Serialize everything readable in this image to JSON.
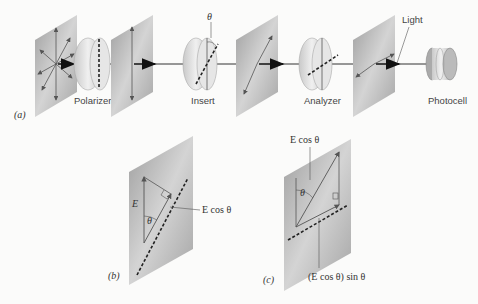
{
  "figure": {
    "part_a": {
      "tag": "(a)",
      "labels": {
        "polarizer": "Polarizer",
        "insert": "Insert",
        "analyzer": "Analyzer",
        "light": "Light",
        "photocell": "Photocell",
        "theta": "θ"
      }
    },
    "part_b": {
      "tag": "(b)",
      "labels": {
        "E": "E",
        "theta": "θ",
        "component": "E cos θ"
      }
    },
    "part_c": {
      "tag": "(c)",
      "labels": {
        "top_component": "E cos θ",
        "theta": "θ",
        "bottom_component": "(E cos θ) sin θ"
      }
    },
    "colors": {
      "plate": "#a9a9a9",
      "plate_light": "#d2d2d2",
      "lens": "#d8d8d8",
      "arrow": "#555555",
      "background": "#fbfbfa"
    }
  }
}
